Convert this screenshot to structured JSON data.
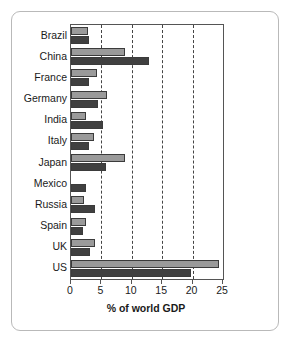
{
  "chart_data": {
    "type": "bar",
    "orientation": "horizontal",
    "title": "",
    "subtitle": "",
    "xlabel": "% of world GDP",
    "ylabel": "",
    "xlim": [
      0,
      25
    ],
    "xticks": [
      0,
      5,
      10,
      15,
      20,
      25
    ],
    "xtick_labels": [
      "0",
      "5",
      "10",
      "15",
      "20",
      "25"
    ],
    "grid": "vertical-dashed",
    "legend": "none",
    "categories": [
      "Brazil",
      "China",
      "France",
      "Germany",
      "India",
      "Italy",
      "Japan",
      "Mexico",
      "Russia",
      "Spain",
      "UK",
      "US"
    ],
    "series": [
      {
        "name": "series-a",
        "color": "#9a9a9a",
        "values": [
          2.8,
          8.8,
          4.2,
          5.9,
          2.5,
          3.8,
          8.8,
          0,
          2.2,
          2.4,
          4.0,
          24.4
        ]
      },
      {
        "name": "series-b",
        "color": "#404040",
        "values": [
          2.9,
          12.9,
          3.0,
          4.4,
          5.3,
          3.0,
          5.8,
          2.5,
          4.0,
          1.9,
          3.1,
          19.7
        ]
      }
    ]
  },
  "figure": {
    "border_color": "#b9b9b9",
    "background": "#ffffff",
    "axis_color": "#555555",
    "gridline_color": "#444444"
  }
}
